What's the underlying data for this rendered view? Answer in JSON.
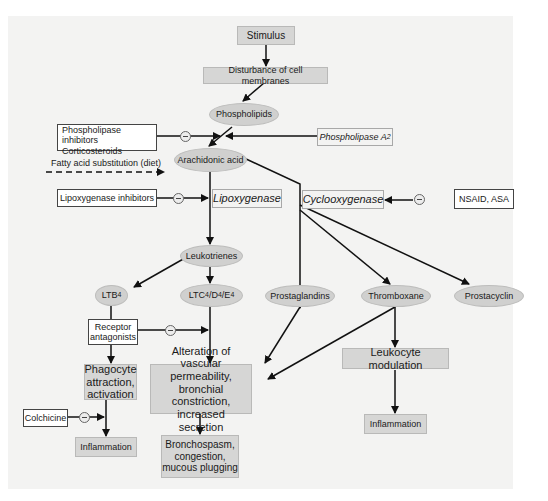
{
  "diagram": {
    "colors": {
      "panel": "#f3f3f2",
      "node_fill": "#d6d6d5",
      "ellipse_fill": "#d0d0cf",
      "line": "#111111"
    },
    "nodes": {
      "stimulus": "Stimulus",
      "disturbance": "Disturbance of cell membranes",
      "phospholipids": "Phospholipids",
      "phospholipase_inhibitors_1": "Phospholipase inhibitors",
      "phospholipase_inhibitors_2": "Corticosteroids",
      "phospholipase_a2": "Phospholipase A",
      "phospholipase_a2_sub": "2",
      "fatty_acid": "Fatty acid substitution (diet)",
      "arachidonic_acid": "Arachidonic acid",
      "lipoxygenase_inhibitors": "Lipoxygenase inhibitors",
      "lipoxygenase": "Lipoxygenase",
      "cyclooxygenase": "Cyclooxygenase",
      "nsaid": "NSAID, ASA",
      "leukotrienes": "Leukotrienes",
      "ltb4": "LTB",
      "ltb4_sub": "4",
      "ltc": "LTC",
      "ltc_sub": "4",
      "ltd": "/D",
      "ltd_sub": "4",
      "lte": "/E",
      "lte_sub": "4",
      "prostaglandins": "Prostaglandins",
      "thromboxane": "Thromboxane",
      "prostacyclin": "Prostacyclin",
      "receptor_antagonists_1": "Receptor",
      "receptor_antagonists_2": "antagonists",
      "phagocyte_1": "Phagocyte",
      "phagocyte_2": "attraction,",
      "phagocyte_3": "activation",
      "alteration_1": "Alteration of vascular",
      "alteration_2": "permeability, bronchial",
      "alteration_3": "constriction, increased",
      "alteration_4": "secretion",
      "leukocyte_modulation": "Leukocyte modulation",
      "colchicine": "Colchicine",
      "inflammation_left": "Inflammation",
      "bronchospasm_1": "Bronchospasm,",
      "bronchospasm_2": "congestion,",
      "bronchospasm_3": "mucous plugging",
      "inflammation_right": "Inflammation"
    },
    "inhibition_symbol": "⊖"
  }
}
